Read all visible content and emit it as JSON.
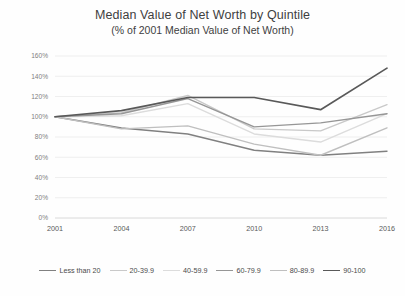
{
  "chart_data": {
    "type": "line",
    "title": "Median Value of Net Worth by Quintile",
    "subtitle": "(% of 2001 Median Value of Net Worth)",
    "xlabel": "",
    "ylabel": "",
    "x": [
      "2001",
      "2004",
      "2007",
      "2010",
      "2013",
      "2016"
    ],
    "categories": [
      "2001",
      "2004",
      "2007",
      "2010",
      "2013",
      "2016"
    ],
    "ylim": [
      0,
      160
    ],
    "ytick_labels": [
      "0%",
      "20%",
      "40%",
      "60%",
      "80%",
      "100%",
      "120%",
      "140%",
      "160%"
    ],
    "ytick_values": [
      0,
      20,
      40,
      60,
      80,
      100,
      120,
      140,
      160
    ],
    "grid": true,
    "legend_position": "bottom",
    "series": [
      {
        "name": "Less than 20",
        "color": "#808080",
        "width": 1.5,
        "values": [
          100,
          89,
          83,
          67,
          62,
          66
        ]
      },
      {
        "name": "20-39.9",
        "color": "#c9c9c9",
        "width": 1.4,
        "values": [
          100,
          104,
          121,
          88,
          86,
          112
        ]
      },
      {
        "name": "40-59.9",
        "color": "#dcdcdc",
        "width": 1.4,
        "values": [
          100,
          101,
          113,
          83,
          75,
          103
        ]
      },
      {
        "name": "60-79.9",
        "color": "#969696",
        "width": 1.4,
        "values": [
          100,
          103,
          118,
          90,
          94,
          103
        ]
      },
      {
        "name": "80-89.9",
        "color": "#bfbfbf",
        "width": 1.4,
        "values": [
          100,
          88,
          91,
          73,
          62,
          89
        ]
      },
      {
        "name": "90-100",
        "color": "#595959",
        "width": 1.7,
        "values": [
          100,
          106,
          119,
          119,
          107,
          148
        ]
      }
    ]
  }
}
